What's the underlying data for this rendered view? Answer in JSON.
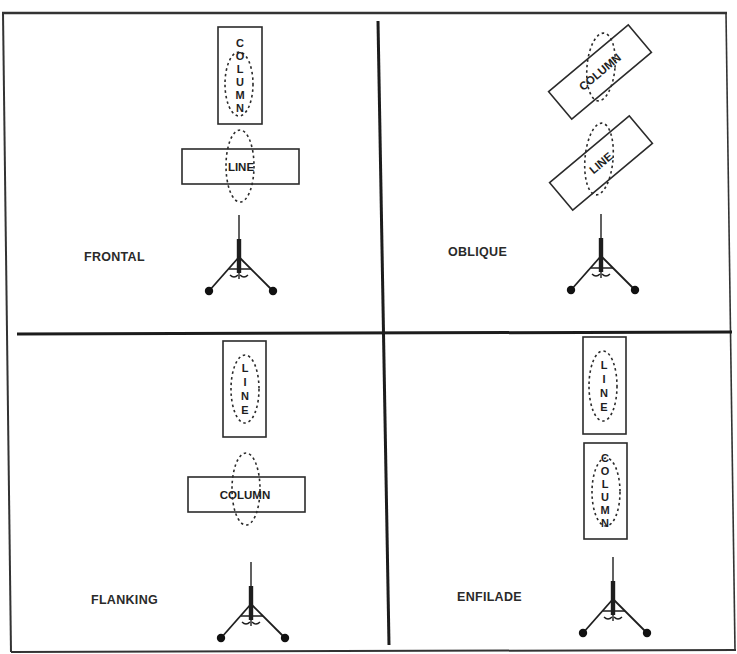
{
  "figure": {
    "colors": {
      "ink": "#1e1e1e",
      "background": "#ffffff"
    },
    "quadrants": [
      {
        "id": "frontal",
        "label": "FRONTAL",
        "formations": [
          {
            "name": "COLUMN",
            "letters": [
              "C",
              "O",
              "L",
              "U",
              "M",
              "N"
            ],
            "orientation": "vertical"
          },
          {
            "name": "LINE",
            "letters": [
              "L",
              "I",
              "N",
              "E"
            ],
            "orientation": "horizontal"
          }
        ],
        "weapon": "machine-gun-on-tripod"
      },
      {
        "id": "oblique",
        "label": "OBLIQUE",
        "formations": [
          {
            "name": "COLUMN",
            "orientation": "diagonal"
          },
          {
            "name": "LINE",
            "orientation": "diagonal"
          }
        ],
        "weapon": "machine-gun-on-tripod"
      },
      {
        "id": "flanking",
        "label": "FLANKING",
        "formations": [
          {
            "name": "LINE",
            "letters": [
              "L",
              "I",
              "N",
              "E"
            ],
            "orientation": "vertical"
          },
          {
            "name": "COLUMN",
            "letters": [
              "C",
              "O",
              "L",
              "U",
              "M",
              "N"
            ],
            "orientation": "horizontal"
          }
        ],
        "weapon": "machine-gun-on-tripod"
      },
      {
        "id": "enfilade",
        "label": "ENFILADE",
        "formations": [
          {
            "name": "LINE",
            "letters": [
              "L",
              "I",
              "N",
              "E"
            ],
            "orientation": "vertical"
          },
          {
            "name": "COLUMN",
            "letters": [
              "C",
              "O",
              "L",
              "U",
              "M",
              "N"
            ],
            "orientation": "vertical"
          }
        ],
        "weapon": "machine-gun-on-tripod"
      }
    ]
  }
}
